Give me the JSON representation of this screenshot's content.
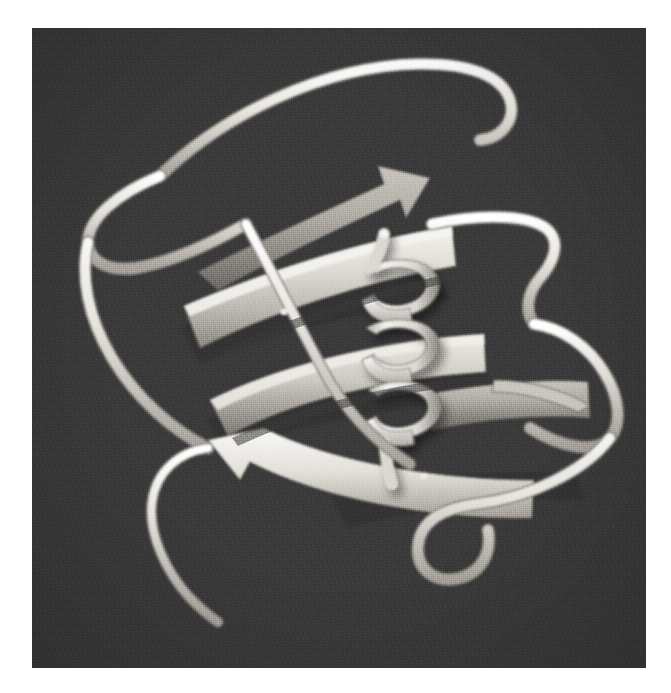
{
  "figure": {
    "domain": "Natural-Image",
    "kind": "protein-ribbon-diagram",
    "caption": "",
    "alt_text": "Grayscale ribbon (cartoon) rendering of a small protein domain showing a twisted antiparallel beta-sheet of broad flat arrow strands crossed by a short central alpha helix, with thin tube loops wrapping the exterior and a long extended tail descending to the lower left.",
    "background_color": "#3b3b3b",
    "border_color": "#ffffff",
    "panel": {
      "x": 32,
      "y": 28,
      "width": 614,
      "height": 640
    },
    "palette": {
      "ribbon_highlight": "#f2f0ec",
      "ribbon_light": "#e0ddd7",
      "ribbon_mid": "#c3bfb8",
      "ribbon_shade": "#a09c95",
      "ribbon_dark_edge": "#6f6c67",
      "coil_tube": "#eeebe5",
      "coil_tube_shade": "#b3afa8",
      "background": "#3b3b3b",
      "background_noise_dark": "#2e2e2e",
      "background_noise_light": "#4a4a4a"
    },
    "structure": {
      "secondary_structure_counts": {
        "beta_strands": 5,
        "alpha_helices": 1,
        "loops": 7
      },
      "helix": {
        "turns": 3,
        "label": "central-alpha-helix",
        "center_x": 395,
        "center_y": 350
      }
    },
    "elements": [
      {
        "id": "strand-1",
        "type": "beta-strand",
        "label": "beta-strand-upper-back"
      },
      {
        "id": "strand-2",
        "type": "beta-strand",
        "label": "beta-strand-upper"
      },
      {
        "id": "strand-3",
        "type": "beta-strand",
        "label": "beta-strand-middle"
      },
      {
        "id": "strand-4",
        "type": "beta-strand",
        "label": "beta-strand-lower"
      },
      {
        "id": "strand-5",
        "type": "beta-strand",
        "label": "beta-strand-right"
      },
      {
        "id": "helix-1",
        "type": "alpha-helix",
        "label": "central-alpha-helix"
      },
      {
        "id": "loop-top",
        "type": "loop",
        "label": "loop-top-arc"
      },
      {
        "id": "loop-left-upper",
        "type": "loop",
        "label": "loop-left-upper"
      },
      {
        "id": "loop-left-lower",
        "type": "loop",
        "label": "loop-left-lower"
      },
      {
        "id": "loop-right-upper",
        "type": "loop",
        "label": "loop-right-upper"
      },
      {
        "id": "loop-right-lower",
        "type": "loop",
        "label": "loop-right-lower"
      },
      {
        "id": "loop-bottom",
        "type": "loop",
        "label": "loop-bottom-hook"
      },
      {
        "id": "tail",
        "type": "terminus-tail",
        "label": "extended-tail-lower-left"
      }
    ]
  }
}
